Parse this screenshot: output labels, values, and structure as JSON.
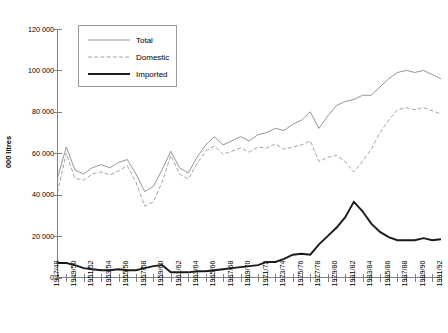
{
  "chart_data": {
    "type": "line",
    "title": "",
    "xlabel": "",
    "ylabel": "000 litres",
    "ylim": [
      0,
      120000
    ],
    "grid": false,
    "legend_position": "top-left-inside",
    "y_ticks": [
      "0",
      "20 000",
      "40 000",
      "60 000",
      "80 000",
      "100 000",
      "120 000"
    ],
    "y_tick_values": [
      0,
      20000,
      40000,
      60000,
      80000,
      100000,
      120000
    ],
    "categories": [
      "1947/48",
      "1948/49",
      "1949/50",
      "1950/51",
      "1951/52",
      "1952/53",
      "1953/54",
      "1954/55",
      "1955/56",
      "1956/57",
      "1957/58",
      "1958/59",
      "1959/60",
      "1960/61",
      "1961/62",
      "1962/63",
      "1963/64",
      "1964/65",
      "1965/66",
      "1966/67",
      "1967/68",
      "1968/69",
      "1969/70",
      "1970/71",
      "1971/72",
      "1972/73",
      "1973/74",
      "1974/75",
      "1975/76",
      "1976/77",
      "1977/78",
      "1978/79",
      "1979/80",
      "1980/81",
      "1981/82",
      "1982/83",
      "1983/84",
      "1984/85",
      "1985/86",
      "1986/87",
      "1987/88",
      "1988/89",
      "1989/90",
      "1990/91",
      "1991/92"
    ],
    "x_tick_labels": [
      "1947/48",
      "1949/50",
      "1951/52",
      "1953/54",
      "1955/56",
      "1957/58",
      "1959/60",
      "1961/62",
      "1963/64",
      "1965/66",
      "1967/68",
      "1969/70",
      "1971/72",
      "1973/74",
      "1975/76",
      "1977/78",
      "1979/80",
      "1981/82",
      "1983/84",
      "1985/86",
      "1987/88",
      "1989/90",
      "1991/92"
    ],
    "series": [
      {
        "name": "Total",
        "style": "thin-solid",
        "color": "#8a8a8a",
        "values": [
          48000,
          63000,
          52000,
          50000,
          53000,
          54500,
          53000,
          55500,
          57000,
          50000,
          41500,
          44000,
          52000,
          61000,
          53000,
          50500,
          58000,
          64000,
          68000,
          64000,
          66000,
          68000,
          66000,
          69000,
          70000,
          72000,
          71000,
          74000,
          76000,
          80000,
          72000,
          78000,
          83000,
          85000,
          86000,
          88000,
          88000,
          92000,
          96000,
          99000,
          100000,
          99000,
          100000,
          98000,
          96000
        ]
      },
      {
        "name": "Domestic",
        "style": "dashed",
        "color": "#9a9a9a",
        "values": [
          41000,
          60000,
          48000,
          47000,
          50000,
          51000,
          49500,
          51500,
          54000,
          46000,
          34500,
          36500,
          46000,
          59000,
          50000,
          47500,
          55000,
          61000,
          63500,
          59500,
          61000,
          62500,
          60500,
          63000,
          62500,
          64500,
          62000,
          63000,
          64000,
          66000,
          56000,
          58000,
          59000,
          56000,
          51000,
          56000,
          62000,
          70000,
          76000,
          81000,
          82000,
          81000,
          82000,
          80500,
          79000
        ]
      },
      {
        "name": "Imported",
        "style": "thick-solid",
        "color": "#1a1a1a",
        "values": [
          7000,
          7000,
          6000,
          4500,
          4000,
          3500,
          3500,
          4000,
          3500,
          3500,
          4500,
          5500,
          6000,
          2500,
          2500,
          2500,
          3000,
          3000,
          3500,
          4000,
          4500,
          5000,
          5500,
          6000,
          7500,
          7500,
          9000,
          11000,
          11500,
          11000,
          16000,
          20000,
          24000,
          29000,
          36500,
          32000,
          26000,
          22000,
          19500,
          18000,
          18000,
          18000,
          19000,
          18000,
          18500
        ]
      }
    ],
    "legend": [
      {
        "label": "Total",
        "style": "thin-solid"
      },
      {
        "label": "Domestic",
        "style": "dashed"
      },
      {
        "label": "Imported",
        "style": "thick-solid"
      }
    ]
  }
}
